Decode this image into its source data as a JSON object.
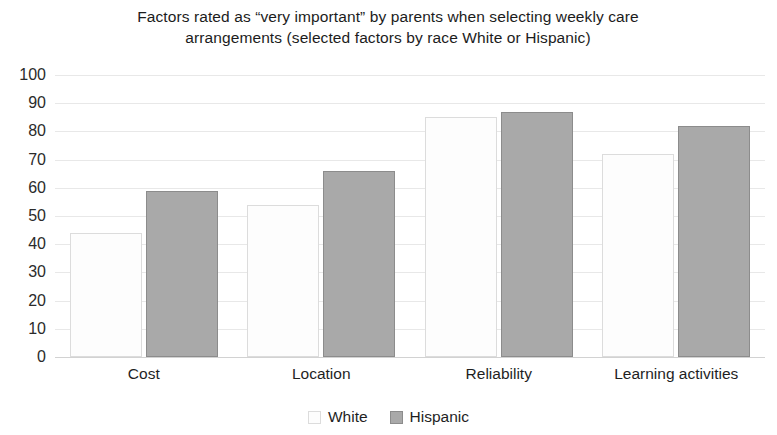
{
  "chart_data": {
    "type": "bar",
    "title": "Factors rated as “very important” by parents when selecting weekly care arrangements (selected factors by race White or Hispanic)",
    "title_line1": "Factors rated as “very important” by parents when selecting weekly care",
    "title_line2": "arrangements (selected factors by race White or Hispanic)",
    "categories": [
      "Cost",
      "Location",
      "Reliability",
      "Learning activities"
    ],
    "series": [
      {
        "name": "White",
        "values": [
          44,
          54,
          85,
          72
        ],
        "color": "#fdfdfd",
        "border": "#dcdcdc"
      },
      {
        "name": "Hispanic",
        "values": [
          59,
          66,
          87,
          82
        ],
        "color": "#a9a9a9",
        "border": "#8c8c8c"
      }
    ],
    "xlabel": "",
    "ylabel": "",
    "ylim": [
      0,
      100
    ],
    "ytick_step": 10,
    "yticks": [
      100,
      90,
      80,
      70,
      60,
      50,
      40,
      30,
      20,
      10,
      0
    ],
    "grid": true,
    "grid_axis": "y",
    "legend_position": "bottom",
    "legend": [
      "White",
      "Hispanic"
    ],
    "background": "#ffffff",
    "gridline_color": "#e8e8e8"
  }
}
